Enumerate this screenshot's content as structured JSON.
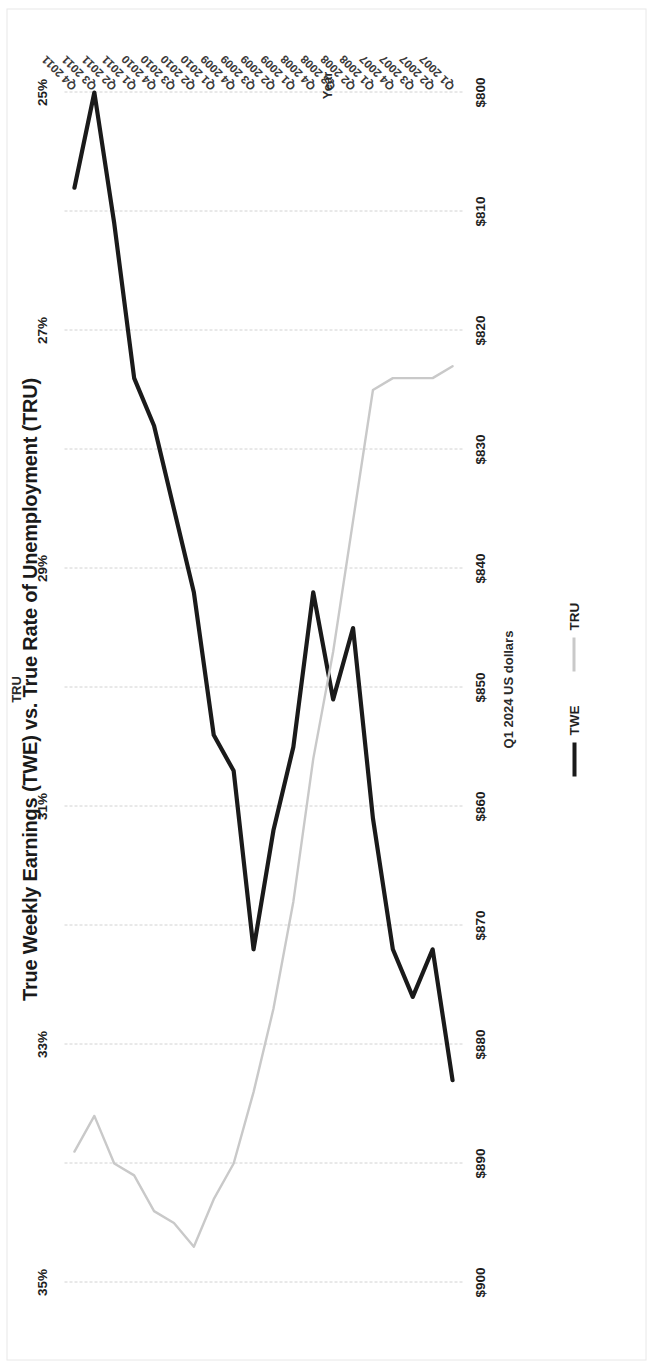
{
  "chart_data": {
    "type": "line",
    "title": "True Weekly Earnings (TWE) vs. True Rate of Unemployment (TRU)",
    "xlabel": "Year",
    "ylabel": "Q1 2024 US dollars",
    "y2label": "TRU",
    "grid": true,
    "legend_position": "bottom",
    "orientation": "rotated-90",
    "categories": [
      "Q1 2007",
      "Q2 2007",
      "Q3 2007",
      "Q4 2007",
      "Q1 2008",
      "Q2 2008",
      "Q3 2008",
      "Q4 2008",
      "Q1 2009",
      "Q2 2009",
      "Q3 2009",
      "Q4 2009",
      "Q1 2010",
      "Q2 2010",
      "Q3 2010",
      "Q4 2010",
      "Q1 2011",
      "Q2 2011",
      "Q3 2011",
      "Q4 2011"
    ],
    "ylim": [
      800,
      900
    ],
    "yticks": [
      "$800",
      "$810",
      "$820",
      "$830",
      "$840",
      "$850",
      "$860",
      "$870",
      "$880",
      "$890",
      "$900"
    ],
    "ytick_values": [
      800,
      810,
      820,
      830,
      840,
      850,
      860,
      870,
      880,
      890,
      900
    ],
    "y2lim": [
      25,
      35
    ],
    "y2ticks": [
      "25%",
      "27%",
      "29%",
      "31%",
      "33%",
      "35%"
    ],
    "y2tick_values": [
      25,
      27,
      29,
      31,
      33,
      35
    ],
    "series": [
      {
        "name": "TWE",
        "axis": "left",
        "color": "#1a1a1a",
        "width": 4.2,
        "values": [
          883,
          872,
          876,
          872,
          861,
          845,
          851,
          842,
          855,
          862,
          872,
          857,
          854,
          842,
          835,
          828,
          824,
          811,
          800,
          808
        ]
      },
      {
        "name": "TRU",
        "axis": "right",
        "color": "#c9c9c9",
        "width": 2.4,
        "values": [
          27.3,
          27.4,
          27.4,
          27.4,
          27.5,
          28.6,
          29.7,
          30.6,
          31.8,
          32.7,
          33.4,
          34.0,
          34.3,
          34.7,
          34.5,
          34.4,
          34.1,
          34.0,
          33.6,
          33.9
        ]
      }
    ]
  },
  "legend": {
    "items": [
      {
        "label": "TWE",
        "marker": "solid-black-line"
      },
      {
        "label": "TRU",
        "marker": "solid-gray-line"
      }
    ]
  }
}
